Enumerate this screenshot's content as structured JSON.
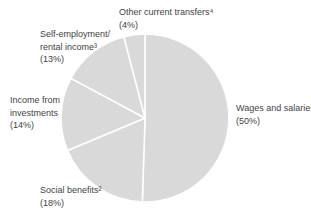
{
  "chart_data": {
    "type": "pie",
    "title": "",
    "units": "%",
    "start_angle_deg": 0,
    "direction": "clockwise",
    "pie_color": "#d9d9d9",
    "divider_color": "#ffffff",
    "label_color": "#3f3f3f",
    "legend": "none (direct labels around pie)",
    "slices": [
      {
        "name": "Wages and salaries",
        "value_pct": 50,
        "label_lines": [
          "Wages and salaries¹",
          "(50%)"
        ]
      },
      {
        "name": "Social benefits",
        "value_pct": 18,
        "label_lines": [
          "Social benefits²",
          "(18%)"
        ]
      },
      {
        "name": "Income from investments",
        "value_pct": 14,
        "label_lines": [
          "Income from",
          "investments",
          "(14%)"
        ]
      },
      {
        "name": "Self-employment rental income",
        "value_pct": 13,
        "label_lines": [
          "Self-employment/",
          "rental income³",
          "(13%)"
        ]
      },
      {
        "name": "Other current transfers",
        "value_pct": 4,
        "label_lines": [
          "Other current transfers⁴",
          "(4%)"
        ]
      }
    ]
  }
}
